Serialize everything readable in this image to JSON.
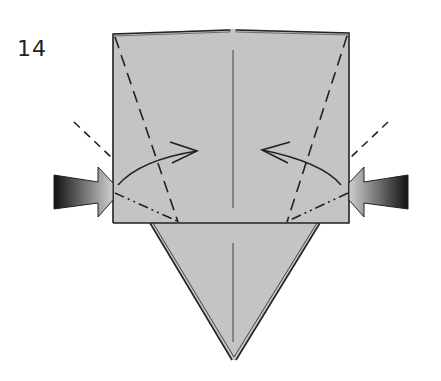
{
  "diagram": {
    "step_number": "14",
    "colors": {
      "paper": "#c4c4c4",
      "line": "#222222",
      "background": "#ffffff"
    },
    "elements": [
      {
        "type": "square-flap",
        "description": "upper square layer"
      },
      {
        "type": "triangle-point",
        "description": "lower triangular point"
      },
      {
        "type": "valley-fold-line",
        "side": "left"
      },
      {
        "type": "valley-fold-line",
        "side": "right"
      },
      {
        "type": "mountain-fold-line",
        "side": "left"
      },
      {
        "type": "mountain-fold-line",
        "side": "right"
      },
      {
        "type": "fold-arrow",
        "side": "left",
        "direction": "in"
      },
      {
        "type": "fold-arrow",
        "side": "right",
        "direction": "in"
      },
      {
        "type": "push-arrow",
        "side": "left"
      },
      {
        "type": "push-arrow",
        "side": "right"
      }
    ]
  }
}
